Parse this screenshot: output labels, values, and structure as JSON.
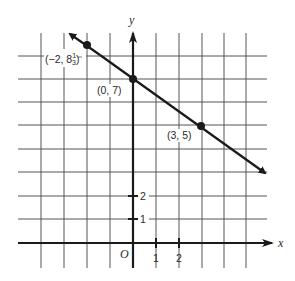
{
  "diagram": {
    "type": "coordinate-plane-line",
    "axes": {
      "x_label": "x",
      "y_label": "y",
      "origin_label": "O",
      "x_ticks": [
        "1",
        "2"
      ],
      "y_ticks": [
        "1",
        "2"
      ]
    },
    "grid": {
      "x_range": [
        -5,
        5
      ],
      "y_range": [
        -1,
        9
      ],
      "unit": 1
    },
    "points": [
      {
        "label": "(−2, 8",
        "frac_num": "1",
        "frac_den": "3",
        "close": ")",
        "x": -2,
        "y": 8.333
      },
      {
        "label": "(0, 7)",
        "x": 0,
        "y": 7
      },
      {
        "label": "(3, 5)",
        "x": 3,
        "y": 5
      }
    ],
    "line": {
      "slope": "-2/3",
      "y_intercept": 7,
      "arrows": "both",
      "color": "#1a1a1a"
    },
    "colors": {
      "grid": "#555555",
      "axis": "#1a1a1a",
      "line": "#1a1a1a",
      "background": "#ffffff"
    }
  }
}
